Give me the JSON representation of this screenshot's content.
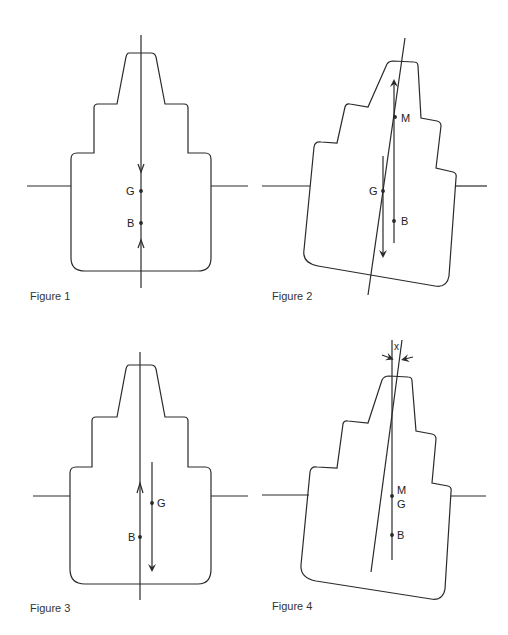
{
  "figures": [
    {
      "caption": "Figure 1",
      "labels": {
        "G": "G",
        "B": "B"
      }
    },
    {
      "caption": "Figure 2",
      "labels": {
        "G": "G",
        "B": "B",
        "M": "M"
      }
    },
    {
      "caption": "Figure 3",
      "labels": {
        "G": "G",
        "B": "B"
      }
    },
    {
      "caption": "Figure 4",
      "labels": {
        "G": "G",
        "B": "B",
        "M": "M",
        "x": "x"
      }
    }
  ],
  "colors": {
    "line": "#2a2a2a",
    "background": "#ffffff"
  }
}
